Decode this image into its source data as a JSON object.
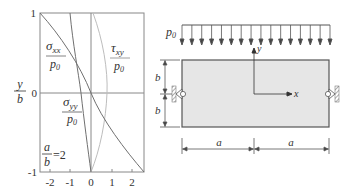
{
  "chart_data": {
    "type": "line",
    "title": "",
    "xlabel": "",
    "ylabel": "y/b",
    "xlim": [
      -2.5,
      2.5
    ],
    "ylim": [
      -1,
      1
    ],
    "x_ticks": [
      "-2",
      "-1",
      "0",
      "1",
      "2"
    ],
    "y_ticks": [
      "1",
      "0",
      "-1"
    ],
    "annotation": "a/b = 2",
    "grid": false,
    "series": [
      {
        "name": "σxx/p0",
        "points": [
          [
            -2.5,
            1
          ],
          [
            -1.3,
            0.6
          ],
          [
            -0.55,
            0.3
          ],
          [
            0,
            0
          ],
          [
            0.55,
            -0.3
          ],
          [
            1.3,
            -0.6
          ],
          [
            2.5,
            -1
          ]
        ]
      },
      {
        "name": "σyy/p0",
        "points": [
          [
            -1.0,
            1
          ],
          [
            -0.85,
            0.5
          ],
          [
            -0.5,
            0
          ],
          [
            -0.2,
            -0.5
          ],
          [
            0,
            -1
          ]
        ]
      },
      {
        "name": "τxy/p0",
        "points": [
          [
            0.05,
            1
          ],
          [
            0.55,
            0.5
          ],
          [
            0.75,
            0
          ],
          [
            0.55,
            -0.5
          ],
          [
            0,
            -1
          ]
        ]
      }
    ]
  },
  "chart": {
    "y_axis_label_num": "y",
    "y_axis_label_den": "b",
    "x_ticks": [
      "-2",
      "-1",
      "0",
      "1",
      "2"
    ],
    "y_ticks": {
      "top": "1",
      "mid": "0",
      "bottom": "-1"
    },
    "ratio": {
      "num": "a",
      "den": "b",
      "value": "=2"
    },
    "labels": {
      "sxx": {
        "sym": "σ",
        "sub": "xx",
        "den": "p",
        "den_sub": "0"
      },
      "syy": {
        "sym": "σ",
        "sub": "yy",
        "den": "p",
        "den_sub": "0"
      },
      "txy": {
        "sym": "τ",
        "sub": "xy",
        "den": "p",
        "den_sub": "0"
      }
    },
    "colors": {
      "sxx": "#6e6e6e",
      "syy": "#6e6e6e",
      "txy": "#b8b8b8",
      "axis": "#888888"
    }
  },
  "diagram": {
    "load_label": "p",
    "load_sub": "0",
    "arrow_count": 16,
    "axis_x": "x",
    "axis_y": "y",
    "dim_b_top": "b",
    "dim_b_bottom": "b",
    "dim_a_left": "a",
    "dim_a_right": "a",
    "colors": {
      "plate_fill": "#e6e6e6",
      "line": "#555555"
    }
  }
}
